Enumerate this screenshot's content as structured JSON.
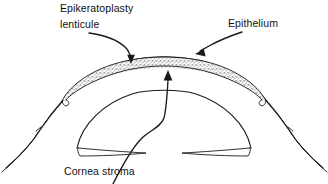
{
  "figure": {
    "type": "anatomical-line-diagram",
    "background_color": "#ffffff",
    "ink_color": "#1a1a1a",
    "stipple_color": "#555555"
  },
  "labels": {
    "epikeratoplasty": {
      "line1": "Epikeratoplasty",
      "line2": "lenticule",
      "x": 60,
      "y": 12,
      "leader_target_x": 131,
      "leader_target_y": 62
    },
    "epithelium": {
      "text": "Epithelium",
      "x": 228,
      "y": 27,
      "leader_target_x": 196,
      "leader_target_y": 52
    },
    "cornea_stroma": {
      "text": "Cornea stroma",
      "x": 64,
      "y": 175,
      "leader_target_x": 168,
      "leader_target_y": 72
    }
  },
  "structures": [
    {
      "name": "epithelium-line",
      "description": "thin outer arc over the cornea"
    },
    {
      "name": "lenticule-band",
      "description": "stippled graft band beneath epithelium"
    },
    {
      "name": "cornea-stroma-dome",
      "description": "inner dome arc of corneal stroma"
    },
    {
      "name": "limbus-left",
      "description": "left scleral taper"
    },
    {
      "name": "limbus-right",
      "description": "right scleral taper"
    },
    {
      "name": "anterior-chamber-sliver-left",
      "description": "thin lens sliver lower left"
    },
    {
      "name": "anterior-chamber-sliver-right",
      "description": "thin lens sliver lower right"
    }
  ]
}
